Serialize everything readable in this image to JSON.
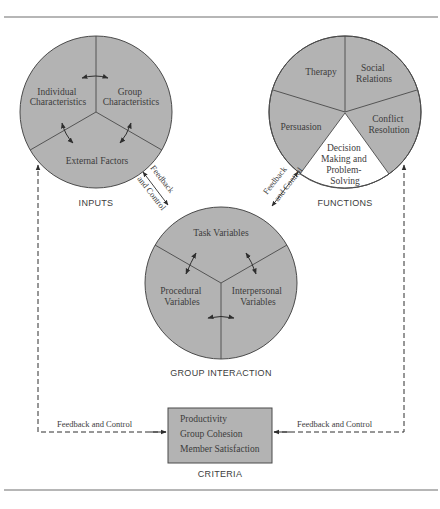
{
  "colors": {
    "fill": "#b3b3b3",
    "stroke": "#4a4a4a",
    "white_segment": "#ffffff",
    "rule": "#6e6e6e"
  },
  "inputs": {
    "caption": "INPUTS",
    "segments": [
      {
        "lines": [
          "Individual",
          "Characteristics"
        ]
      },
      {
        "lines": [
          "Group",
          "Characteristics"
        ]
      },
      {
        "lines": [
          "External Factors"
        ]
      }
    ]
  },
  "functions": {
    "caption": "FUNCTIONS",
    "segments": [
      {
        "lines": [
          "Therapy"
        ]
      },
      {
        "lines": [
          "Social",
          "Relations"
        ]
      },
      {
        "lines": [
          "Conflict",
          "Resolution"
        ]
      },
      {
        "lines": [
          "Decision",
          "Making and",
          "Problem-",
          "Solving"
        ],
        "highlight": "white"
      },
      {
        "lines": [
          "Persuasion"
        ]
      }
    ]
  },
  "group_interaction": {
    "caption": "GROUP INTERACTION",
    "segments": [
      {
        "lines": [
          "Task Variables"
        ]
      },
      {
        "lines": [
          "Procedural",
          "Variables"
        ]
      },
      {
        "lines": [
          "Interpersonal",
          "Variables"
        ]
      }
    ]
  },
  "links": {
    "inputs_group": {
      "line1": "Feedback",
      "line2": "and Control"
    },
    "functions_group": {
      "line1": "Feedback",
      "line2": "and Control"
    },
    "left_loop": "Feedback and Control",
    "right_loop": "Feedback and Control"
  },
  "criteria": {
    "caption": "CRITERIA",
    "items": [
      "Productivity",
      "Group Cohesion",
      "Member Satisfaction"
    ]
  }
}
